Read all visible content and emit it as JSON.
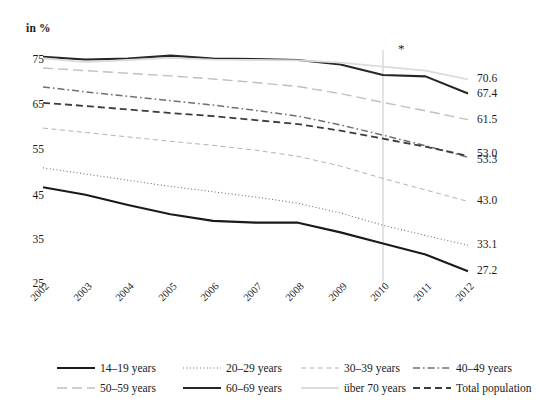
{
  "chart_data": {
    "type": "line",
    "title": "in %",
    "xlabel": "",
    "ylabel": "in %",
    "ylim": [
      25,
      78
    ],
    "xlim": [
      2002,
      2012
    ],
    "grid": false,
    "legend_position": "bottom",
    "annotation": "*",
    "annotation_x": 2010,
    "ytick_labels": [
      "75",
      "65",
      "55",
      "45",
      "35",
      "25"
    ],
    "ytick_values": [
      75,
      65,
      55,
      45,
      35,
      25
    ],
    "categories": [
      "2002",
      "2003",
      "2004",
      "2005",
      "2006",
      "2007",
      "2008",
      "2009",
      "2010",
      "2011",
      "2012"
    ],
    "x": [
      2002,
      2003,
      2004,
      2005,
      2006,
      2007,
      2008,
      2009,
      2010,
      2011,
      2012
    ],
    "series": [
      {
        "name": "14–19 years",
        "style": "solid-thick-dark",
        "color": "#1a1a1a",
        "values": [
          46.2,
          44.5,
          42.2,
          40.1,
          38.6,
          38.2,
          38.2,
          36.0,
          33.5,
          31.0,
          27.2
        ],
        "end_label": "27.2"
      },
      {
        "name": "20–29 years",
        "style": "dotted",
        "color": "#6e6e6e",
        "values": [
          50.6,
          49.2,
          47.8,
          46.4,
          45.2,
          44.0,
          42.6,
          40.4,
          37.6,
          35.3,
          33.1
        ],
        "end_label": "33.1"
      },
      {
        "name": "30–39 years",
        "style": "dashed-light",
        "color": "#b4b4b4",
        "values": [
          59.6,
          58.6,
          57.6,
          56.6,
          55.7,
          54.6,
          53.2,
          51.0,
          48.2,
          45.6,
          43.0
        ],
        "end_label": "43.0"
      },
      {
        "name": "40–49 years",
        "style": "dash-dot",
        "color": "#707070",
        "values": [
          68.9,
          67.8,
          66.8,
          65.8,
          64.8,
          63.6,
          62.3,
          60.3,
          58.0,
          55.6,
          53.0
        ],
        "end_label": "53.0"
      },
      {
        "name": "50–59 years",
        "style": "long-dash-light",
        "color": "#bfbfbf",
        "values": [
          73.2,
          72.6,
          72.0,
          71.4,
          70.7,
          69.9,
          69.0,
          67.4,
          65.4,
          63.5,
          61.5
        ],
        "end_label": "61.5"
      },
      {
        "name": "60–69 years",
        "style": "solid-thick-dark",
        "color": "#262626",
        "values": [
          75.7,
          75.1,
          75.3,
          76.0,
          75.3,
          75.2,
          75.0,
          74.0,
          71.6,
          71.3,
          67.4
        ],
        "end_label": "67.4"
      },
      {
        "name": "über 70 years",
        "style": "solid-very-light",
        "color": "#dcdcdc",
        "values": [
          75.4,
          74.5,
          75.0,
          75.5,
          75.1,
          75.0,
          74.9,
          74.4,
          73.5,
          72.6,
          70.6
        ],
        "end_label": "70.6"
      },
      {
        "name": "Total population",
        "style": "dashed-dark",
        "color": "#3c3c3c",
        "values": [
          65.3,
          64.6,
          63.8,
          63.0,
          62.3,
          61.4,
          60.5,
          59.0,
          57.2,
          55.4,
          53.3
        ],
        "end_label": "53.3"
      }
    ]
  },
  "end_labels": [
    {
      "text": "70.6",
      "value": 70.6
    },
    {
      "text": "67.4",
      "value": 67.4
    },
    {
      "text": "61.5",
      "value": 61.5
    },
    {
      "text": "53.0",
      "value": 53.0
    },
    {
      "text": "53.3",
      "value": 53.3
    },
    {
      "text": "43.0",
      "value": 43.0
    },
    {
      "text": "33.1",
      "value": 33.1
    },
    {
      "text": "27.2",
      "value": 27.2
    }
  ],
  "legend": {
    "rows": [
      [
        {
          "label": "14–19 years",
          "style": "solid-thick-dark"
        },
        {
          "label": "20–29 years",
          "style": "dotted"
        },
        {
          "label": "30–39 years",
          "style": "dashed-light"
        },
        {
          "label": "40–49 years",
          "style": "dash-dot"
        }
      ],
      [
        {
          "label": "50–59 years",
          "style": "long-dash-light"
        },
        {
          "label": "60–69 years",
          "style": "solid-thick-dark"
        },
        {
          "label": "über 70 years",
          "style": "solid-very-light"
        },
        {
          "label": "Total population",
          "style": "dashed-dark"
        }
      ]
    ]
  },
  "colors": {
    "axis": "#1a1a1a",
    "marker_line": "#c8c8c8",
    "background": "#ffffff"
  }
}
